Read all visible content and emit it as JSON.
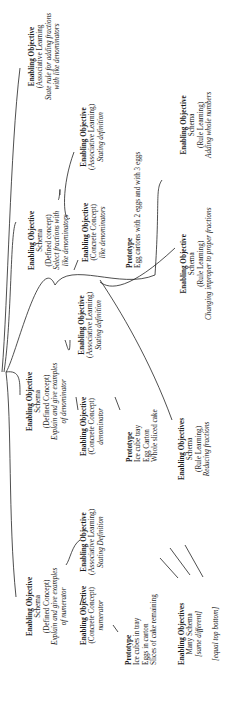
{
  "diagram": {
    "orientation": "rotated -90deg",
    "root_branches": "curved lines from a root point at left edge",
    "nodes": [
      {
        "id": "n1",
        "lines": [
          "Enabling Objective",
          "(Associative Learning",
          "State rule for adding fractions",
          "with like denominators"
        ]
      },
      {
        "id": "n2",
        "lines": [
          "Enabling Objective",
          "(Associative Learning)",
          "Stating definition"
        ]
      },
      {
        "id": "n3",
        "lines": [
          "Enabling Objective",
          "Schema",
          "(Rule Learning)",
          "Adding whole numbers"
        ]
      },
      {
        "id": "n4",
        "lines": [
          "Enabling Objective",
          "Schema",
          "(Defined concept)",
          "Select fractions with",
          "like denominators"
        ]
      },
      {
        "id": "n5",
        "lines": [
          "Enabling Objective",
          "(Concrete Concept)",
          "like denominators"
        ]
      },
      {
        "id": "n6",
        "lines": [
          "Prototype",
          "Egg cartons with 2 eggs and with 3 eggs"
        ]
      },
      {
        "id": "n7",
        "lines": [
          "Enabling Objective",
          "Schema",
          "(Rule Learning)",
          "Changing improper to proper fractions"
        ]
      },
      {
        "id": "n8",
        "lines": [
          "Enabling Objective",
          "(Associative Learning)",
          "Stating definition"
        ]
      },
      {
        "id": "n9",
        "lines": [
          "Enabling Objective",
          "Schema",
          "(Defined Concept)",
          "Explain and give examples",
          "of denominator"
        ]
      },
      {
        "id": "n10",
        "lines": [
          "Enabling Objective",
          "(Concrete Concept)",
          "denominator"
        ]
      },
      {
        "id": "n11",
        "lines": [
          "Prototype",
          "Ice cube tray",
          "Egg Carton",
          "Whole sliced cake"
        ]
      },
      {
        "id": "n12",
        "lines": [
          "Enabling Objectives",
          "Schema",
          "(Rule Learning)",
          "Reducing fractions"
        ]
      },
      {
        "id": "n13",
        "lines": [
          "Enabling Objective",
          "Schema",
          "(Defined Concept)",
          "Explain and give examples",
          "of numerator"
        ]
      },
      {
        "id": "n14",
        "lines": [
          "Enabling Objective",
          "(Associative Learning)",
          "Stating Definition"
        ]
      },
      {
        "id": "n15",
        "lines": [
          "Enabling Objective",
          "(Concrete Concept)",
          "numerator"
        ]
      },
      {
        "id": "n16",
        "lines": [
          "Prototype",
          "Ice cubes in tray",
          "Eggs in carton",
          "Slices of cake remaining"
        ]
      },
      {
        "id": "n17",
        "lines": [
          "Enabling Objectives",
          "Many Schema",
          "[same different]",
          "",
          "[equal top bottom]"
        ]
      }
    ]
  }
}
